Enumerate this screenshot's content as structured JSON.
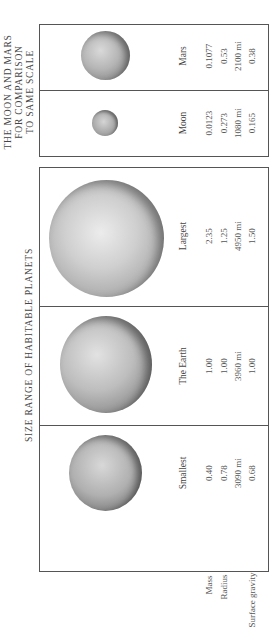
{
  "comparison_panel": {
    "title_lines": [
      "THE MOON AND MARS",
      "FOR COMPARISON",
      "TO SAME SCALE"
    ],
    "bodies": [
      {
        "name": "Mars",
        "mass": "0.1077",
        "radius": "0.53",
        "radius_mi": "2100 mi",
        "surface_gravity": "0.38"
      },
      {
        "name": "Moon",
        "mass": "0.0123",
        "radius": "0.273",
        "radius_mi": "1080 mi",
        "surface_gravity": "0.165"
      }
    ]
  },
  "habitable_panel": {
    "title": "SIZE RANGE OF HABITABLE PLANETS",
    "bodies": [
      {
        "name": "Largest",
        "mass": "2.35",
        "radius": "1.25",
        "radius_mi": "4950 mi",
        "surface_gravity": "1.50"
      },
      {
        "name": "The Earth",
        "mass": "1.00",
        "radius": "1.00",
        "radius_mi": "3960 mi",
        "surface_gravity": "1.00"
      },
      {
        "name": "Smallest",
        "mass": "0.40",
        "radius": "0.78",
        "radius_mi": "3090 mi",
        "surface_gravity": "0.68"
      }
    ]
  },
  "row_labels": {
    "mass": "Mass",
    "radius": "Radius",
    "surface_gravity": "Surface gravity"
  },
  "colors": {
    "frame": "#555555",
    "text": "#444444",
    "background": "#ffffff"
  }
}
